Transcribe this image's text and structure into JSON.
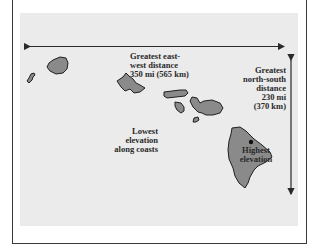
{
  "map": {
    "title": "Hawaiian Islands relief features",
    "colors": {
      "background": "#ebebeb",
      "island_fill": "#8a8a8a",
      "island_outline": "#1f1f1f",
      "arrow": "#2a2a2a",
      "frame": "#3a3a3a"
    },
    "labels": {
      "east_west": "Greatest east-\nwest distance\n350 mi (565 km)",
      "north_south": "Greatest\nnorth-south\ndistance\n230 mi\n(370 km)",
      "lowest": "Lowest\nelevation\nalong coasts",
      "highest": "Highest\nelevation"
    },
    "islands": [
      "Niihau",
      "Kauai",
      "Oahu",
      "Molokai",
      "Lanai",
      "Maui",
      "Kahoolawe",
      "Hawaii"
    ],
    "markers": [
      {
        "name": "highest-point",
        "symbol": "dot"
      }
    ]
  }
}
